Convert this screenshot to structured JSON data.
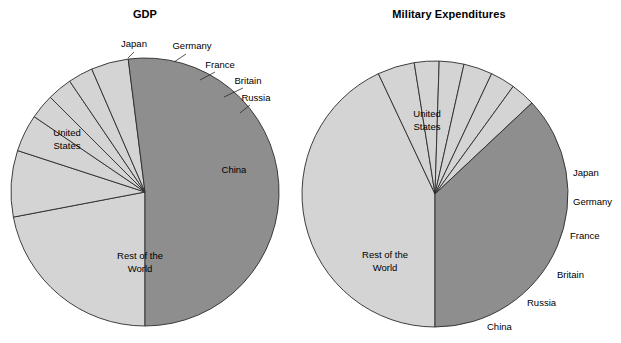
{
  "figure": {
    "background": "#ffffff",
    "width": 621,
    "height": 343
  },
  "colors": {
    "light_slice": "#d4d4d4",
    "dark_slice": "#8e8e8e",
    "outline": "#2b2b2b",
    "text": "#000000"
  },
  "charts": [
    {
      "id": "gdp",
      "title": "GDP",
      "title_x": 145,
      "title_y": 18,
      "center_x": 145,
      "center_y": 192,
      "radius": 134,
      "start_angle_deg": 180,
      "labels": {
        "united_states": "United States",
        "japan": "Japan",
        "germany": "Germany",
        "france": "France",
        "britain": "Britain",
        "russia": "Russia",
        "china": "China",
        "rest_of_world": "Rest of the World"
      }
    },
    {
      "id": "military",
      "title": "Military Expenditures",
      "title_x": 449,
      "title_y": 18,
      "center_x": 435,
      "center_y": 194,
      "radius": 133,
      "start_angle_deg": 180,
      "labels": {
        "united_states": "United States",
        "japan": "Japan",
        "germany": "Germany",
        "france": "France",
        "britain": "Britain",
        "russia": "Russia",
        "china": "China",
        "rest_of_world": "Rest of the World"
      }
    }
  ],
  "chart_data": [
    {
      "type": "pie",
      "id": "gdp",
      "title": "GDP",
      "xlabel": "",
      "ylabel": "",
      "legend": "none",
      "labels": [
        "United States",
        "Japan",
        "Germany",
        "France",
        "Britain",
        "Russia",
        "China",
        "Rest of the World"
      ],
      "values": [
        22,
        8,
        4.5,
        3,
        3,
        3,
        4.5,
        52
      ],
      "colors": [
        "#d4d4d4",
        "#d4d4d4",
        "#d4d4d4",
        "#d4d4d4",
        "#d4d4d4",
        "#d4d4d4",
        "#d4d4d4",
        "#8e8e8e"
      ],
      "units": "percent of world total",
      "start_angle_deg": 180,
      "direction": "clockwise"
    },
    {
      "type": "pie",
      "id": "military",
      "title": "Military Expenditures",
      "xlabel": "",
      "ylabel": "",
      "legend": "none",
      "labels": [
        "United States",
        "Japan",
        "Germany",
        "France",
        "Britain",
        "Russia",
        "China",
        "Rest of the World"
      ],
      "values": [
        43,
        4.5,
        3,
        3,
        3.5,
        3,
        3,
        37
      ],
      "colors": [
        "#d4d4d4",
        "#d4d4d4",
        "#d4d4d4",
        "#d4d4d4",
        "#d4d4d4",
        "#d4d4d4",
        "#d4d4d4",
        "#8e8e8e"
      ],
      "units": "percent of world total",
      "start_angle_deg": 180,
      "direction": "clockwise"
    }
  ],
  "annotations": {
    "gdp": [
      {
        "name": "japan",
        "text": "Japan",
        "x": 134,
        "y": 47,
        "anchor": "mid",
        "leader": [
          [
            134,
            52
          ],
          [
            128,
            58
          ]
        ]
      },
      {
        "name": "germany",
        "text": "Germany",
        "x": 192,
        "y": 49,
        "anchor": "mid",
        "leader": [
          [
            186,
            54
          ],
          [
            174,
            62
          ]
        ]
      },
      {
        "name": "france",
        "text": "France",
        "x": 220,
        "y": 68,
        "anchor": "mid",
        "leader": [
          [
            215,
            72
          ],
          [
            200,
            80
          ]
        ]
      },
      {
        "name": "britain",
        "text": "Britain",
        "x": 248,
        "y": 84,
        "anchor": "mid",
        "leader": [
          [
            243,
            88
          ],
          [
            224,
            97
          ]
        ]
      },
      {
        "name": "russia",
        "text": "Russia",
        "x": 256,
        "y": 101,
        "anchor": "mid",
        "leader": [
          [
            250,
            105
          ],
          [
            240,
            113
          ]
        ]
      },
      {
        "name": "china",
        "text": "China",
        "x": 234,
        "y": 173,
        "anchor": "mid",
        "leader": null
      },
      {
        "name": "united-states-1",
        "text": "United",
        "x": 67,
        "y": 136,
        "anchor": "mid",
        "leader": null
      },
      {
        "name": "united-states-2",
        "text": "States",
        "x": 67,
        "y": 149,
        "anchor": "mid",
        "leader": null
      },
      {
        "name": "rest-of-world-1",
        "text": "Rest of the",
        "x": 140,
        "y": 259,
        "anchor": "mid",
        "leader": null
      },
      {
        "name": "rest-of-world-2",
        "text": "World",
        "x": 140,
        "y": 272,
        "anchor": "mid",
        "leader": null
      }
    ],
    "military": [
      {
        "name": "united-states-1",
        "text": "United",
        "x": 427,
        "y": 117,
        "anchor": "mid",
        "leader": null
      },
      {
        "name": "united-states-2",
        "text": "States",
        "x": 427,
        "y": 130,
        "anchor": "mid",
        "leader": null
      },
      {
        "name": "japan",
        "text": "Japan",
        "x": 573,
        "y": 176,
        "anchor": "start",
        "leader": null
      },
      {
        "name": "germany",
        "text": "Germany",
        "x": 573,
        "y": 205,
        "anchor": "start",
        "leader": null
      },
      {
        "name": "france",
        "text": "France",
        "x": 570,
        "y": 239,
        "anchor": "start",
        "leader": null
      },
      {
        "name": "britain",
        "text": "Britain",
        "x": 557,
        "y": 278,
        "anchor": "start",
        "leader": null
      },
      {
        "name": "russia",
        "text": "Russia",
        "x": 527,
        "y": 306,
        "anchor": "start",
        "leader": null
      },
      {
        "name": "china",
        "text": "China",
        "x": 487,
        "y": 330,
        "anchor": "start",
        "leader": null
      },
      {
        "name": "rest-of-world-1",
        "text": "Rest of the",
        "x": 385,
        "y": 258,
        "anchor": "mid",
        "leader": null
      },
      {
        "name": "rest-of-world-2",
        "text": "World",
        "x": 385,
        "y": 271,
        "anchor": "mid",
        "leader": null
      }
    ]
  }
}
